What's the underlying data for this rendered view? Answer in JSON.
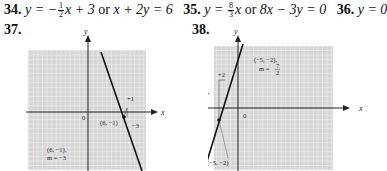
{
  "answers": [
    {
      "number": "34.",
      "eq1_lhs": "y = −",
      "frac_num": "1",
      "frac_den": "2",
      "eq1_rhs": "x + 3",
      "or": "or",
      "eq2": "x + 2y = 6"
    },
    {
      "number": "35.",
      "eq1_lhs": "y = ",
      "frac_num": "8",
      "frac_den": "3",
      "eq1_rhs": "x",
      "or": "or",
      "eq2": "8x − 3y = 0"
    },
    {
      "number": "36.",
      "eq": "y = 0"
    }
  ],
  "graphs": [
    {
      "number": "37.",
      "x_label": "x",
      "y_label": "y",
      "origin_label": "0",
      "point_label": "(6, −1)",
      "rise_label": "+1",
      "run_label": "−3",
      "info_line1": "(6, −1),",
      "info_line2": "m = −3"
    },
    {
      "number": "38.",
      "x_label": "x",
      "y_label": "y",
      "origin_label": "0",
      "point_label": "(−5, −2)",
      "rise_label": "+7",
      "run_label": "+2",
      "info_line1": "(−5, −2),",
      "info_line2": "m = ",
      "slope_num": "7",
      "slope_den": "2"
    }
  ],
  "colors": {
    "grid_bg": "#d6d6d6",
    "grid_line": "#ffffff",
    "axis": "#222222",
    "line": "#111111"
  }
}
